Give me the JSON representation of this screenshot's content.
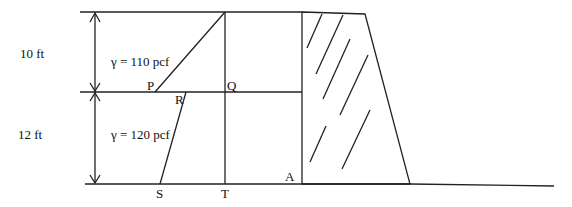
{
  "diagram": {
    "layers": [
      {
        "thickness_label": "10 ft",
        "unit_weight_label": "γ = 110 pcf"
      },
      {
        "thickness_label": "12 ft",
        "unit_weight_label": "γ = 120 pcf"
      }
    ],
    "points": {
      "P": "P",
      "Q": "Q",
      "R": "R",
      "S": "S",
      "T": "T",
      "A": "A"
    },
    "colors": {
      "line": "#222222",
      "background": "#ffffff"
    }
  }
}
